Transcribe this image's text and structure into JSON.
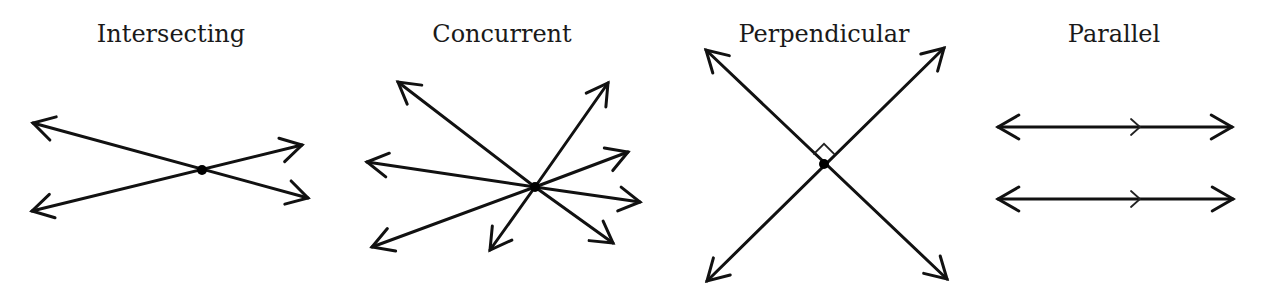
{
  "diagrams": [
    {
      "id": "intersecting",
      "label": "Intersecting",
      "label_pos": [
        171,
        26
      ],
      "point": [
        202,
        170
      ],
      "show_point": true,
      "lines": [
        {
          "from": [
            33,
            123
          ],
          "to": [
            308,
            198
          ],
          "head_from": true,
          "head_to": true
        },
        {
          "from": [
            32,
            211
          ],
          "to": [
            302,
            145
          ],
          "head_from": true,
          "head_to": true
        }
      ]
    },
    {
      "id": "concurrent",
      "label": "Concurrent",
      "label_pos": [
        502,
        26
      ],
      "point": [
        535,
        187
      ],
      "show_point": true,
      "rays": [
        [
          398,
          82
        ],
        [
          367,
          162
        ],
        [
          372,
          247
        ],
        [
          490,
          250
        ],
        [
          608,
          83
        ],
        [
          628,
          152
        ],
        [
          640,
          202
        ],
        [
          613,
          243
        ]
      ]
    },
    {
      "id": "perpendicular",
      "label": "Perpendicular",
      "label_pos": [
        824,
        26
      ],
      "point": [
        824,
        164
      ],
      "show_point": true,
      "right_angle_mark": true,
      "lines": [
        {
          "from": [
            706,
            50
          ],
          "to": [
            947,
            279
          ],
          "head_from": true,
          "head_to": true
        },
        {
          "from": [
            707,
            281
          ],
          "to": [
            944,
            48
          ],
          "head_from": true,
          "head_to": true
        }
      ]
    },
    {
      "id": "parallel",
      "label": "Parallel",
      "label_pos": [
        1114,
        26
      ],
      "show_point": false,
      "parallel_tick_x": 1140,
      "lines": [
        {
          "from": [
            998,
            127
          ],
          "to": [
            1232,
            127
          ],
          "head_from": true,
          "head_to": true
        },
        {
          "from": [
            998,
            199
          ],
          "to": [
            1233,
            199
          ],
          "head_from": true,
          "head_to": true
        }
      ]
    }
  ]
}
